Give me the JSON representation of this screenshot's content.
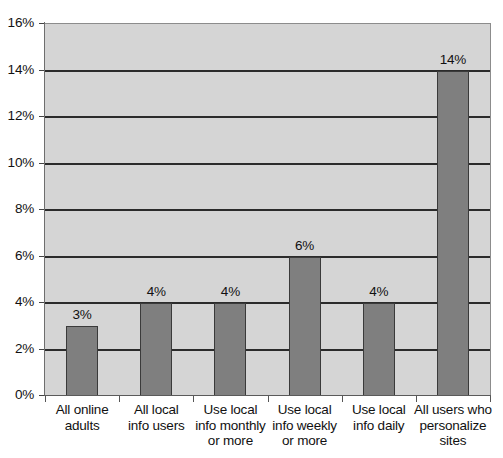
{
  "chart_data": {
    "type": "bar",
    "title": "",
    "subtitle": "",
    "xlabel": "",
    "ylabel": "",
    "ylim": [
      0,
      16
    ],
    "ytick_step": 2,
    "grid": true,
    "legend": false,
    "orientation": "vertical",
    "categories": [
      "All online adults",
      "All local info users",
      "Use local info monthly or more",
      "Use local info weekly or more",
      "Use local info daily",
      "All users who personalize sites"
    ],
    "category_lines": [
      [
        "All online",
        "adults"
      ],
      [
        "All local",
        "info users"
      ],
      [
        "Use local",
        "info monthly",
        "or more"
      ],
      [
        "Use local",
        "info weekly",
        "or more"
      ],
      [
        "Use local",
        "info daily"
      ],
      [
        "All users who",
        "personalize",
        "sites"
      ]
    ],
    "values": [
      3,
      4,
      4,
      6,
      4,
      14
    ],
    "value_labels": [
      "3%",
      "4%",
      "4%",
      "6%",
      "4%",
      "14%"
    ],
    "ytick_labels": [
      "0%",
      "2%",
      "4%",
      "6%",
      "8%",
      "10%",
      "12%",
      "14%",
      "16%"
    ],
    "ytick_values": [
      0,
      2,
      4,
      6,
      8,
      10,
      12,
      14,
      16
    ]
  },
  "colors": {
    "bar_fill": "#7f7f7f",
    "bar_stroke": "#3a3a3a",
    "plot_background": "#d5d5d5",
    "gridline": "#2b2b2b",
    "axis": "#5a5a5a",
    "text": "#111111",
    "page_background": "#ffffff"
  }
}
